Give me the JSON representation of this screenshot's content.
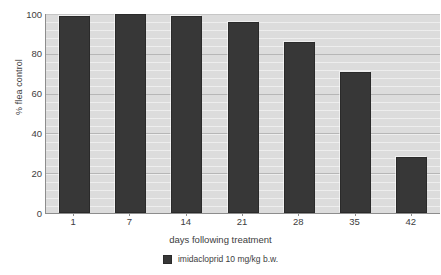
{
  "chart_data": {
    "type": "bar",
    "title": "",
    "subtitle": "",
    "xlabel": "days following treatment",
    "ylabel": "% flea control",
    "categories": [
      "1",
      "7",
      "14",
      "21",
      "28",
      "35",
      "42"
    ],
    "values": [
      99,
      100,
      99,
      96,
      86,
      71,
      28
    ],
    "series": [
      {
        "name": "imidacloprid 10 mg/kg b.w.",
        "values": [
          99,
          100,
          99,
          96,
          86,
          71,
          28
        ],
        "color": "#373737"
      }
    ],
    "ylim": [
      0,
      100
    ],
    "y_ticks": [
      "0",
      "20",
      "40",
      "60",
      "80",
      "100"
    ],
    "y_tick_values": [
      0,
      20,
      40,
      60,
      80,
      100
    ],
    "grid": true,
    "grid_axis": "y",
    "legend": [
      {
        "label": "imidacloprid 10 mg/kg b.w.",
        "color": "#373737",
        "swatch": "filled-square-swatch"
      }
    ],
    "legend_position": "bottom-center",
    "plot_background": "#dcdcdc",
    "axis_color": "#8d8d8d",
    "text_color": "#3d3d3d"
  }
}
